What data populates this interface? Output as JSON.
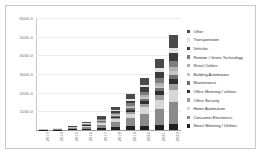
{
  "page": {
    "top_text": "",
    "bottom_caption": ""
  },
  "chart_data": {
    "type": "bar",
    "stacked": true,
    "title": "",
    "subtitle": "",
    "xlabel": "",
    "ylabel": "",
    "grid": true,
    "legend_position": "right",
    "ylim": [
      0,
      6000
    ],
    "yticks": [
      1000,
      2000,
      3000,
      4000,
      5000,
      6000
    ],
    "ytick_labels": [
      "1000.0",
      "2000.0",
      "3000.0",
      "4000.0",
      "5000.0",
      "6000.0"
    ],
    "categories": [
      "2013",
      "2014",
      "2015",
      "2016",
      "2017",
      "2018",
      "2019",
      "2020",
      "2021",
      "2022"
    ],
    "series": [
      {
        "name": "Smart Metering / Utilities",
        "color": "#1f1f1f",
        "values": [
          10,
          22,
          45,
          80,
          130,
          170,
          200,
          235,
          265,
          300
        ]
      },
      {
        "name": "Consumer Electronics",
        "color": "#8a8a8a",
        "values": [
          8,
          18,
          40,
          80,
          150,
          260,
          430,
          640,
          880,
          1180
        ]
      },
      {
        "name": "Home Automation",
        "color": "#d6d6d6",
        "values": [
          4,
          9,
          20,
          42,
          80,
          140,
          225,
          335,
          470,
          640
        ]
      },
      {
        "name": "Office Security",
        "color": "#9e9e9e",
        "values": [
          3,
          6,
          13,
          26,
          48,
          82,
          130,
          190,
          260,
          350
        ]
      },
      {
        "name": "Office Metering / utilities",
        "color": "#2e2e2e",
        "values": [
          2,
          5,
          10,
          20,
          36,
          60,
          95,
          140,
          195,
          260
        ]
      },
      {
        "name": "Maintenance",
        "color": "#6f6f6f",
        "values": [
          2,
          4,
          9,
          17,
          31,
          52,
          82,
          120,
          168,
          225
        ]
      },
      {
        "name": "Building Automation",
        "color": "#c4c4c4",
        "values": [
          2,
          4,
          8,
          15,
          27,
          45,
          72,
          106,
          148,
          200
        ]
      },
      {
        "name": "Retail Outlets",
        "color": "#b0b0b0",
        "values": [
          2,
          4,
          8,
          15,
          27,
          46,
          73,
          108,
          151,
          205
        ]
      },
      {
        "name": "Remote / Green Technology",
        "color": "#7d7d7d",
        "values": [
          3,
          6,
          12,
          24,
          45,
          78,
          125,
          186,
          260,
          352
        ]
      },
      {
        "name": "Vehicles",
        "color": "#3c3c3c",
        "values": [
          3,
          7,
          15,
          30,
          56,
          96,
          152,
          226,
          316,
          428
        ]
      },
      {
        "name": "Transportation",
        "color": "#e2e2e2",
        "values": [
          2,
          4,
          9,
          18,
          34,
          58,
          92,
          136,
          190,
          258
        ]
      },
      {
        "name": "Other",
        "color": "#4a4a4a",
        "values": [
          5,
          11,
          24,
          48,
          90,
          153,
          244,
          362,
          507,
          687
        ]
      }
    ],
    "legend_order": [
      "Other",
      "Transportation",
      "Vehicles",
      "Remote / Green Technology",
      "Retail Outlets",
      "Building Automation",
      "Maintenance",
      "Office Metering / utilities",
      "Office Security",
      "Home Automation",
      "Consumer Electronics",
      "Smart Metering / Utilities"
    ]
  }
}
